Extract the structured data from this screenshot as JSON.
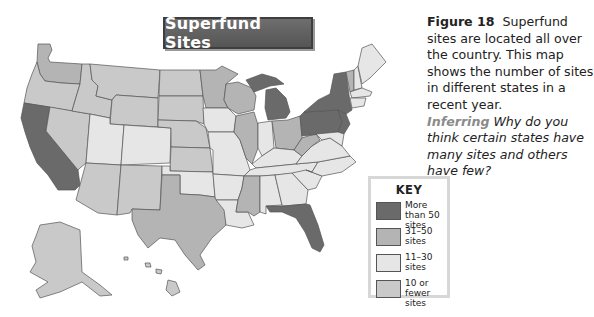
{
  "map": {
    "title": "Superfund Sites",
    "states_by_category": {
      "more_than_50": [
        "California",
        "Michigan",
        "New York",
        "Pennsylvania",
        "New Jersey",
        "Florida"
      ],
      "31_50": [
        "Washington",
        "Wisconsin",
        "Illinois",
        "Ohio",
        "Minnesota?",
        "Texas",
        "Mississippi",
        "West Virginia",
        "Vermont"
      ],
      "11_30": [
        "Utah",
        "Colorado",
        "Iowa",
        "Missouri",
        "Oklahoma",
        "Arkansas",
        "Louisiana",
        "Indiana",
        "Kentucky",
        "Tennessee",
        "Alabama",
        "Georgia",
        "Virginia",
        "North Carolina",
        "South Carolina",
        "Maine",
        "New Hampshire",
        "Massachusetts"
      ],
      "10_or_fewer": [
        "Oregon",
        "Idaho",
        "Montana",
        "Wyoming",
        "Nevada",
        "Arizona",
        "New Mexico",
        "North Dakota",
        "South Dakota",
        "Nebraska",
        "Kansas",
        "Alaska",
        "Hawaii"
      ]
    }
  },
  "caption": {
    "figure_label": "Figure 18",
    "text": "Superfund sites are located all over the country. This map shows the number of sites in different states in a recent year.",
    "inferring_label": "Inferring",
    "question": "Why do you think certain states have many sites and others have few?"
  },
  "key": {
    "title": "KEY",
    "items": [
      {
        "label": "More than 50 sites",
        "color": "#6a6a6a"
      },
      {
        "label": "31–50 sites",
        "color": "#b4b4b4"
      },
      {
        "label": "11–30 sites",
        "color": "#e6e6e6"
      },
      {
        "label": "10 or fewer sites",
        "color": "#c9c9c9"
      }
    ]
  }
}
